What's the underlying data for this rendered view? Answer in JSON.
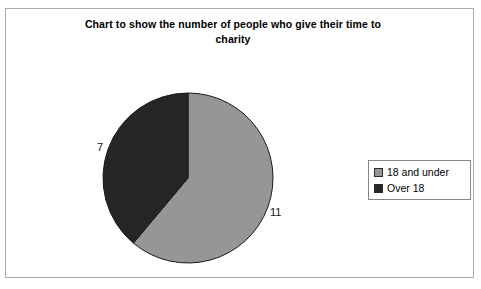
{
  "chart_data": {
    "type": "pie",
    "title": "Chart to show the number of people who give their time to charity",
    "title_line1": "Chart to show the number of people who give their time to",
    "title_line2": "charity",
    "categories": [
      "18 and under",
      "Over 18"
    ],
    "values": [
      11,
      7
    ],
    "total": 18,
    "labels": [
      "11",
      "7"
    ],
    "colors": [
      "#969696",
      "#262626"
    ],
    "start_angle_deg": 0,
    "direction": "clockwise",
    "legend_position": "right",
    "grid": false,
    "xlabel": "",
    "ylabel": "",
    "slices": [
      {
        "name": "18 and under",
        "value": 11,
        "label": "11",
        "color": "#969696",
        "start_deg": 0,
        "sweep_deg": 220
      },
      {
        "name": "Over 18",
        "value": 7,
        "label": "7",
        "color": "#262626",
        "start_deg": 220,
        "sweep_deg": 140
      }
    ]
  },
  "frame": {
    "border_color": "#adadad"
  },
  "legend": {
    "items": [
      {
        "label": "18 and under",
        "color": "#969696"
      },
      {
        "label": "Over 18",
        "color": "#262626"
      }
    ]
  }
}
